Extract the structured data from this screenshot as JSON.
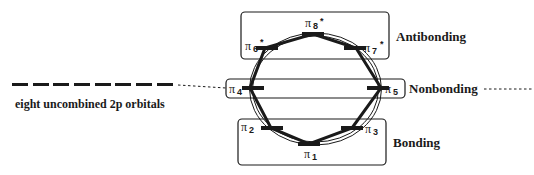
{
  "diagram": {
    "title": "",
    "left_caption": "eight uncombined 2p orbitals",
    "uncombined_orbital_count": 8,
    "regions": [
      {
        "id": "antibonding",
        "label": "Antibonding"
      },
      {
        "id": "nonbonding",
        "label": "Nonbonding"
      },
      {
        "id": "bonding",
        "label": "Bonding"
      }
    ],
    "orbitals": [
      {
        "symbol": "π",
        "index": "1",
        "star": "",
        "region": "bonding"
      },
      {
        "symbol": "π",
        "index": "2",
        "star": "",
        "region": "bonding"
      },
      {
        "symbol": "π",
        "index": "3",
        "star": "",
        "region": "bonding"
      },
      {
        "symbol": "π",
        "index": "4",
        "star": "",
        "region": "nonbonding"
      },
      {
        "symbol": "π",
        "index": "5",
        "star": "",
        "region": "nonbonding"
      },
      {
        "symbol": "π",
        "index": "6",
        "star": "*",
        "region": "antibonding"
      },
      {
        "symbol": "π",
        "index": "7",
        "star": "*",
        "region": "antibonding"
      },
      {
        "symbol": "π",
        "index": "8",
        "star": "*",
        "region": "antibonding"
      }
    ],
    "colors": {
      "ink": "#1a1a1a",
      "background": "#ffffff"
    }
  }
}
